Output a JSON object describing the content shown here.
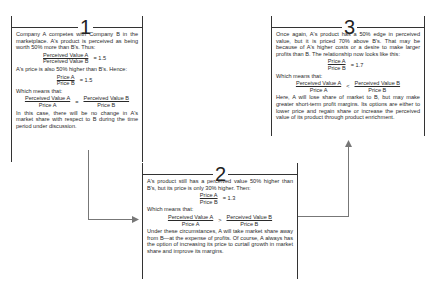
{
  "panels": [
    {
      "number": "1",
      "intro": "Company A competes with Company B in the marketplace. A's product is perceived as being worth 50% more than B's. Thus:",
      "eq1": {
        "num": "Perceived Value A",
        "den": "Perceived Value B",
        "result": "= 1.5"
      },
      "mid": "A's price is also 50% higher than B's. Hence:",
      "eq2": {
        "num": "Price A",
        "den": "Price B",
        "result": "= 1.5"
      },
      "which": "Which means that:",
      "eq3": {
        "lnum": "Perceived Value A",
        "lden": "Price A",
        "op": "=",
        "rnum": "Perceived Value B",
        "rden": "Price B"
      },
      "conclusion": "In this case, there will be no change in A's market share with respect to B during the time period under discussion."
    },
    {
      "number": "2",
      "intro": "A's product still has a perceived value 50% higher than B's, but its price is only 30% higher. Then:",
      "eq2": {
        "num": "Price A",
        "den": "Price B",
        "result": "= 1.3"
      },
      "which": "Which means that:",
      "eq3": {
        "lnum": "Perceived Value A",
        "lden": "Price A",
        "op": ">",
        "rnum": "Perceived Value B",
        "rden": "Price B"
      },
      "conclusion": "Under these circumstances, A will take market share away from B—at the expense of profits. Of course, A always has the option of increasing its price to curtail growth in market share and improve its margins."
    },
    {
      "number": "3",
      "intro": "Once again, A's product has a 50% edge in perceived value, but it is priced 70% above B's. That may be because of A's higher costs or a desire to make larger profits than B. The relationship now looks like this:",
      "eq2": {
        "num": "Price A",
        "den": "Price B",
        "result": "= 1.7"
      },
      "which": "Which means that:",
      "eq3": {
        "lnum": "Perceived Value A",
        "lden": "Price A",
        "op": "<",
        "rnum": "Perceived Value B",
        "rden": "Price B"
      },
      "conclusion": "Here, A will lose share of market to B, but may make greater short-term profit margins. Its options are either to lower price and regain share or increase the perceived value of its product through product enrichment."
    }
  ],
  "colors": {
    "line": "#333333",
    "arrow": "#777777"
  }
}
